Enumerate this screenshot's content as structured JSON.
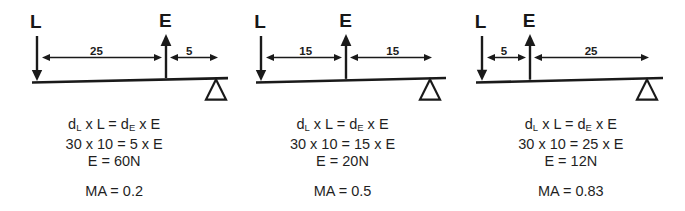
{
  "figure": {
    "type": "lever-mechanical-advantage-diagram",
    "panel_count": 3,
    "stroke_color": "#1a1a1a",
    "background_color": "#ffffff"
  },
  "panels": [
    {
      "id": "panel-1",
      "load_label": "L",
      "effort_label": "E",
      "dim_load_to_effort": "25",
      "dim_effort_to_fulcrum": "5",
      "load_x": 37,
      "effort_x": 166,
      "fulcrum_x": 216,
      "beam_left_x": 32,
      "beam_right_x": 232,
      "dim1_label_x": 90,
      "dim2_label_x": 186,
      "load_label_x": 30,
      "effort_label_x": 159,
      "equations": {
        "line1_pre": "d",
        "line1_sub1": "L",
        "line1_mid": " x L  =  d",
        "line1_sub2": "E",
        "line1_post": " x E",
        "line2": "30 x 10 =  5 x E",
        "line3": "E  = 60N"
      },
      "ma": "MA = 0.2"
    },
    {
      "id": "panel-2",
      "load_label": "L",
      "effort_label": "E",
      "dim_load_to_effort": "15",
      "dim_effort_to_fulcrum": "15",
      "load_x": 33,
      "effort_x": 118,
      "fulcrum_x": 202,
      "beam_left_x": 28,
      "beam_right_x": 218,
      "dim1_label_x": 71,
      "dim2_label_x": 158,
      "load_label_x": 26,
      "effort_label_x": 111,
      "equations": {
        "line1_pre": "d",
        "line1_sub1": "L",
        "line1_mid": " x L  =  d",
        "line1_sub2": "E",
        "line1_post": " x E",
        "line2": "30 x 10 =  15 x E",
        "line3": "E  = 20N"
      },
      "ma": "MA = 0.5"
    },
    {
      "id": "panel-3",
      "load_label": "L",
      "effort_label": "E",
      "dim_load_to_effort": "5",
      "dim_effort_to_fulcrum": "25",
      "load_x": 25,
      "effort_x": 73,
      "fulcrum_x": 190,
      "beam_left_x": 19,
      "beam_right_x": 206,
      "dim1_label_x": 44,
      "dim2_label_x": 128,
      "load_label_x": 18,
      "effort_label_x": 66,
      "equations": {
        "line1_pre": "d",
        "line1_sub1": "L",
        "line1_mid": " x L  =  d",
        "line1_sub2": "E",
        "line1_post": " x E",
        "line2": "30 x 10 =  25 x E",
        "line3": "E  = 12N"
      },
      "ma": "MA = 0.83"
    }
  ]
}
